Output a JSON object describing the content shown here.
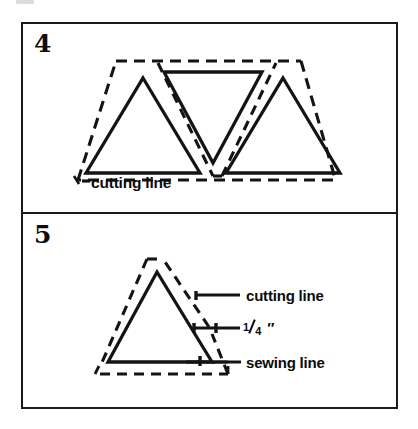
{
  "figure": {
    "kind": "sewing-instruction-diagram",
    "background_color": "#ffffff",
    "ink_color": "#1a1a1a",
    "frame": {
      "border_color": "#1a1a1a",
      "border_width_px": 2
    },
    "panels": [
      {
        "id": "panel-4",
        "number": "4",
        "description": "Three triangles arranged in a strip: two point up at left and right, one points down in the middle, surrounded by a dashed cutting line.",
        "labels": [
          {
            "id": "cutting-line",
            "text": "cutting line"
          }
        ],
        "shapes": {
          "solid_line_style": "solid",
          "dashed_line_style": "dashed",
          "triangle_count": 3,
          "triangles": [
            {
              "orientation": "up"
            },
            {
              "orientation": "down"
            },
            {
              "orientation": "up"
            }
          ]
        }
      },
      {
        "id": "panel-5",
        "number": "5",
        "description": "Single upward triangle (sewing line) with a dashed cutting line offset one quarter inch outside it, with three leader-line callouts.",
        "labels": [
          {
            "id": "cutting-line",
            "text": "cutting line"
          },
          {
            "id": "seam-allowance",
            "numerator": "1",
            "denominator": "4",
            "unit": "″",
            "text": "1/4 ″"
          },
          {
            "id": "sewing-line",
            "text": "sewing line"
          }
        ],
        "shapes": {
          "solid_line_style": "solid",
          "dashed_line_style": "dashed",
          "triangle_count": 1,
          "triangles": [
            {
              "orientation": "up"
            }
          ]
        }
      }
    ]
  }
}
